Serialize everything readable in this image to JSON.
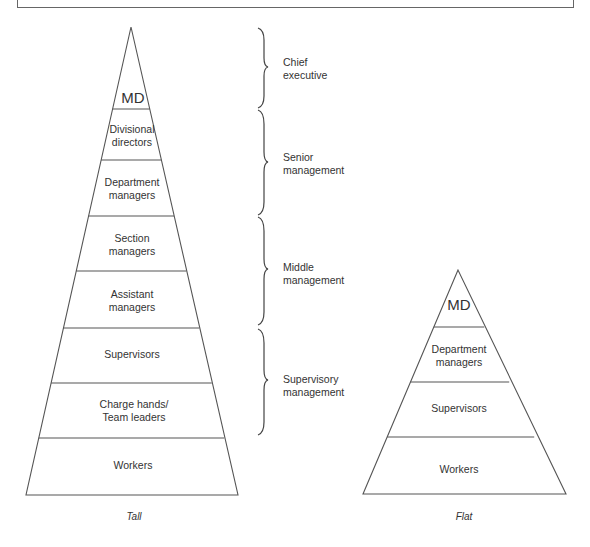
{
  "diagram": {
    "type": "organizational-structure-comparison",
    "tall_pyramid": {
      "caption": "Tall",
      "levels": [
        {
          "label": "MD"
        },
        {
          "label": "Divisional\ndirectors"
        },
        {
          "label": "Department\nmanagers"
        },
        {
          "label": "Section\nmanagers"
        },
        {
          "label": "Assistant\nmanagers"
        },
        {
          "label": "Supervisors"
        },
        {
          "label": "Charge hands/\nTeam leaders"
        },
        {
          "label": "Workers"
        }
      ]
    },
    "management_groups": [
      {
        "label": "Chief\nexecutive"
      },
      {
        "label": "Senior\nmanagement"
      },
      {
        "label": "Middle\nmanagement"
      },
      {
        "label": "Supervisory\nmanagement"
      }
    ],
    "flat_pyramid": {
      "caption": "Flat",
      "levels": [
        {
          "label": "MD"
        },
        {
          "label": "Department\nmanagers"
        },
        {
          "label": "Supervisors"
        },
        {
          "label": "Workers"
        }
      ]
    },
    "colors": {
      "line": "#555555",
      "text": "#333333",
      "background": "#ffffff"
    }
  }
}
